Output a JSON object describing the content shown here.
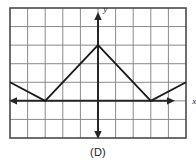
{
  "figure": {
    "caption": "(D)",
    "axis_labels": {
      "x": "x",
      "y": "y"
    },
    "colors": {
      "grid_line": "#8a8a8a",
      "border": "#4a4a4a",
      "axis": "#262626",
      "curve": "#1a1a1a",
      "background": "#ffffff",
      "caption_text": "#1b1b1b"
    }
  },
  "chart_data": {
    "type": "line",
    "title": "",
    "xlabel": "x",
    "ylabel": "y",
    "grid": true,
    "legend": null,
    "xlim": [
      -5,
      5
    ],
    "ylim": [
      -2,
      5
    ],
    "xticks": [
      -5,
      -4,
      -3,
      -2,
      -1,
      0,
      1,
      2,
      3,
      4,
      5
    ],
    "yticks": [
      -2,
      -1,
      0,
      1,
      2,
      3,
      4,
      5
    ],
    "xtick_labels": [],
    "ytick_labels": [],
    "series": [
      {
        "name": "piecewise-linear-zigzag",
        "x": [
          -5,
          -3,
          0,
          3,
          5
        ],
        "y": [
          1,
          0,
          3,
          0,
          1
        ]
      }
    ],
    "annotations": [
      {
        "text": "x",
        "x": 5.35,
        "y": 0
      },
      {
        "text": "y",
        "x": 0.3,
        "y": 4.8
      }
    ],
    "axis_arrows": {
      "x_left": true,
      "x_right": true,
      "y_up": true,
      "y_down": true
    }
  }
}
